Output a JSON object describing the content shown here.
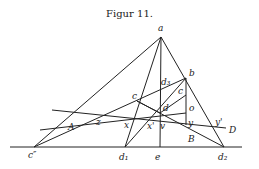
{
  "title": "Figur 11.",
  "labels": {
    "a": "a",
    "b": "b",
    "c": "c",
    "c_prime": "c",
    "c_dd": "c″",
    "d": "d",
    "d1": "d₁",
    "d2": "d₂",
    "d3": "d₃",
    "e": "e",
    "o": "o",
    "y": "y",
    "y_prime": "y'",
    "z": "z",
    "x": "x",
    "x_prime": "x'",
    "v": "v",
    "A": "A",
    "B": "B",
    "D": "D"
  }
}
